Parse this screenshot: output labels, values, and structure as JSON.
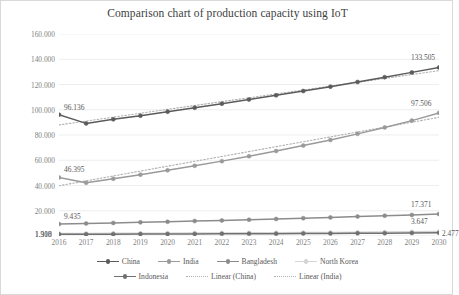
{
  "chart_data": {
    "type": "line",
    "title": "Comparison chart of production capacity using IoT",
    "xlabel": "",
    "ylabel": "",
    "x": [
      2016,
      2017,
      2018,
      2019,
      2020,
      2021,
      2022,
      2023,
      2024,
      2025,
      2026,
      2027,
      2028,
      2029,
      2030
    ],
    "xtick_labels": [
      "2016",
      "2017",
      "2018",
      "2019",
      "2020",
      "2021",
      "2022",
      "2023",
      "2024",
      "2025",
      "2026",
      "2027",
      "2028",
      "2029",
      "2030"
    ],
    "ylim": [
      0,
      160
    ],
    "yticks": [
      0,
      20,
      40,
      60,
      80,
      100,
      120,
      140,
      160
    ],
    "ytick_labels": [
      "0",
      "20.000",
      "40.000",
      "60.000",
      "80.000",
      "100.000",
      "120.000",
      "140.000",
      "160.000"
    ],
    "grid": true,
    "legend_position": "bottom",
    "series": [
      {
        "name": "China",
        "color": "#5b5b5b",
        "values": [
          96.136,
          89.2,
          92.4,
          95.3,
          98.5,
          101.6,
          104.8,
          108.1,
          111.4,
          114.8,
          118.3,
          122.0,
          125.8,
          129.6,
          133.505
        ]
      },
      {
        "name": "India",
        "color": "#9a9a9a",
        "values": [
          46.395,
          42.1,
          45.3,
          48.6,
          52.0,
          55.6,
          59.3,
          63.2,
          67.3,
          71.6,
          76.1,
          80.9,
          86.0,
          91.4,
          97.506
        ]
      },
      {
        "name": "Bangladesh",
        "color": "#8c8c8c",
        "values": [
          9.435,
          9.9,
          10.35,
          10.8,
          11.3,
          11.8,
          12.35,
          12.9,
          13.5,
          14.1,
          14.75,
          15.4,
          16.1,
          16.7,
          17.371
        ]
      },
      {
        "name": "North Korea",
        "color": "#d4d4d4",
        "values": [
          1.9,
          2.0,
          2.08,
          2.16,
          2.25,
          2.34,
          2.43,
          2.53,
          2.63,
          2.74,
          2.86,
          2.99,
          3.15,
          3.38,
          3.647
        ]
      },
      {
        "name": "Indonesia",
        "color": "#707070",
        "values": [
          1.318,
          1.38,
          1.44,
          1.5,
          1.57,
          1.64,
          1.71,
          1.79,
          1.87,
          1.96,
          2.05,
          2.15,
          2.25,
          2.36,
          2.477
        ]
      }
    ],
    "trendlines": [
      {
        "name": "Linear (China)",
        "color": "#b0b0b0",
        "style": "dotted",
        "start": 88.0,
        "end": 131.0
      },
      {
        "name": "Linear (India)",
        "color": "#b0b0b0",
        "style": "dotted",
        "start": 39.8,
        "end": 94.0
      }
    ],
    "data_labels": [
      {
        "name": "china-start-label",
        "text": "96.136",
        "x": 2016,
        "value": 96.136,
        "anchor": "above-right"
      },
      {
        "name": "china-end-label",
        "text": "133.505",
        "x": 2030,
        "value": 133.505,
        "anchor": "above-left"
      },
      {
        "name": "india-start-label",
        "text": "46.395",
        "x": 2016,
        "value": 46.395,
        "anchor": "above-right"
      },
      {
        "name": "india-end-label",
        "text": "97.506",
        "x": 2030,
        "value": 97.506,
        "anchor": "above-left"
      },
      {
        "name": "bangladesh-start-label",
        "text": "9.435",
        "x": 2016,
        "value": 9.435,
        "anchor": "above-right"
      },
      {
        "name": "bangladesh-end-label",
        "text": "17.371",
        "x": 2030,
        "value": 17.371,
        "anchor": "above-left"
      },
      {
        "name": "northkorea-start-label",
        "text": "1.900",
        "x": 2016,
        "value": 1.9,
        "anchor": "left"
      },
      {
        "name": "northkorea-end-label",
        "text": "3.647",
        "x": 2030,
        "value": 3.647,
        "anchor": "above-left"
      },
      {
        "name": "indonesia-start-label",
        "text": "1.318",
        "x": 2016,
        "value": 1.318,
        "anchor": "left"
      },
      {
        "name": "indonesia-end-label",
        "text": "2.477",
        "x": 2030,
        "value": 2.477,
        "anchor": "right"
      }
    ]
  },
  "legend": {
    "items": [
      {
        "label": "China",
        "color": "#5b5b5b",
        "style": "marker-line",
        "row": 0
      },
      {
        "label": "India",
        "color": "#9a9a9a",
        "style": "marker-line",
        "row": 0
      },
      {
        "label": "Bangladesh",
        "color": "#8c8c8c",
        "style": "marker-line",
        "row": 0
      },
      {
        "label": "North Korea",
        "color": "#d4d4d4",
        "style": "marker-line",
        "row": 0
      },
      {
        "label": "Indonesia",
        "color": "#707070",
        "style": "marker-line",
        "row": 1
      },
      {
        "label": "Linear (China)",
        "color": "#b0b0b0",
        "style": "dotted",
        "row": 1
      },
      {
        "label": "Linear (India)",
        "color": "#b0b0b0",
        "style": "dotted",
        "row": 1
      }
    ]
  },
  "colors": {
    "grid": "#e6e6e6",
    "axis": "#d9d9d9",
    "text": "#595959",
    "title": "#404040",
    "background": "#ffffff"
  }
}
